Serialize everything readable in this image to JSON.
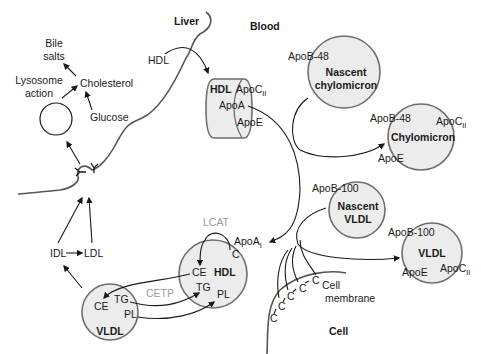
{
  "regions": {
    "liver": "Liver",
    "blood": "Blood",
    "cell": "Cell",
    "cell_membrane_line1": "Cell",
    "cell_membrane_line2": "membrane"
  },
  "liver_metabolism": {
    "bile_line1": "Bile",
    "bile_line2": "salts",
    "lysosome_line1": "Lysosome",
    "lysosome_line2": "action",
    "cholesterol": "Cholesterol",
    "glucose": "Glucose"
  },
  "hdl_liver": {
    "incoming_label": "HDL",
    "title": "HDL",
    "apo_c": "ApoC",
    "apo_c_sub": "II",
    "apo_a": "ApoA",
    "apo_e": "ApoE"
  },
  "nascent_chylomicron": {
    "apo": "ApoB-48",
    "line1": "Nascent",
    "line2": "chylomicron"
  },
  "chylomicron": {
    "apo_b": "ApoB-48",
    "title": "Chylomicron",
    "apo_c": "ApoC",
    "apo_c_sub": "II",
    "apo_e": "ApoE"
  },
  "nascent_vldl": {
    "apo": "ApoB-100",
    "line1": "Nascent",
    "line2": "VLDL"
  },
  "vldl_blood": {
    "apo_b": "ApoB-100",
    "title": "VLDL",
    "apo_e": "ApoE",
    "apo_c": "ApoC",
    "apo_c_sub": "II"
  },
  "hdl_cell": {
    "enzyme": "LCAT",
    "apo_a": "ApoA",
    "apo_a_sub": "I",
    "c": "C",
    "ce": "CE",
    "title": "HDL",
    "tg": "TG",
    "pl": "PL"
  },
  "transfer": {
    "enzyme": "CETP"
  },
  "vldl_cell": {
    "ce": "CE",
    "tg": "TG",
    "pl": "PL",
    "title": "VLDL"
  },
  "remnants": {
    "idl": "IDL",
    "ldl": "LDL"
  },
  "cholesterol_chain": {
    "c": "C"
  }
}
